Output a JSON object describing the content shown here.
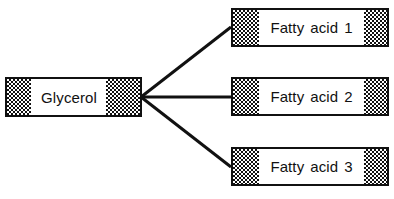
{
  "diagram": {
    "background_color": "#ffffff",
    "line_color": "#111111",
    "hatch_color": "#111111",
    "backbone": {
      "label": "Glycerol",
      "left_cap": "checkerboard-hatch",
      "right_cap": "checkerboard-hatch"
    },
    "branches": [
      {
        "label": "Fatty acid 1",
        "left_cap": "checkerboard-hatch",
        "right_cap": "checkerboard-hatch"
      },
      {
        "label": "Fatty acid 2",
        "left_cap": "checkerboard-hatch",
        "right_cap": "checkerboard-hatch"
      },
      {
        "label": "Fatty acid 3",
        "left_cap": "checkerboard-hatch",
        "right_cap": "checkerboard-hatch"
      }
    ],
    "connectors": [
      {
        "name": "glycerol-to-fatty-acid-1",
        "x1": 141,
        "y1": 97,
        "x2": 231,
        "y2": 27
      },
      {
        "name": "glycerol-to-fatty-acid-2",
        "x1": 141,
        "y1": 97,
        "x2": 231,
        "y2": 97
      },
      {
        "name": "glycerol-to-fatty-acid-3",
        "x1": 141,
        "y1": 97,
        "x2": 231,
        "y2": 167
      }
    ]
  }
}
